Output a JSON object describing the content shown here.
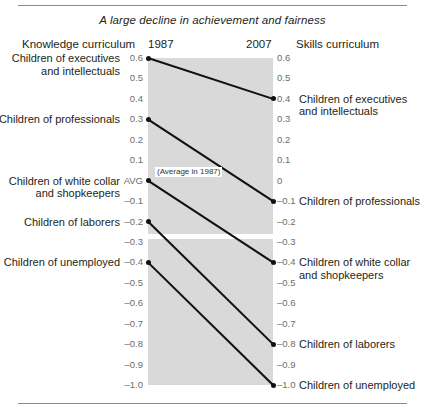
{
  "figure": {
    "title": "A large decline in achievement and fairness",
    "header": {
      "left_label": "Knowledge curriculum",
      "year_start": "1987",
      "year_end": "2007",
      "right_label": "Skills curriculum"
    },
    "annotation": "(Average in 1987)",
    "avg_tick": "AVG"
  },
  "chart_data": {
    "type": "line",
    "subtype": "slopegraph",
    "title": "A large decline in achievement and fairness",
    "xlabel": "",
    "ylabel": "",
    "x": [
      "1987",
      "2007"
    ],
    "ylim": [
      -1.0,
      0.6
    ],
    "grid": false,
    "legend": "none",
    "left_axis_title": "Knowledge curriculum",
    "right_axis_title": "Skills curriculum",
    "annotations": [
      {
        "text": "(Average in 1987)",
        "x": "1987",
        "y": 0.0
      }
    ],
    "yticks_left": [
      {
        "value": 0.6,
        "label": "0.6"
      },
      {
        "value": 0.5,
        "label": "0.5"
      },
      {
        "value": 0.4,
        "label": "0.4"
      },
      {
        "value": 0.3,
        "label": "0.3"
      },
      {
        "value": 0.2,
        "label": "0.2"
      },
      {
        "value": 0.1,
        "label": "0.1"
      },
      {
        "value": 0.0,
        "label": "AVG"
      },
      {
        "value": -0.1,
        "label": "–0.1"
      },
      {
        "value": -0.2,
        "label": "–0.2"
      },
      {
        "value": -0.3,
        "label": "–0.3"
      },
      {
        "value": -0.4,
        "label": "–0.4"
      },
      {
        "value": -0.5,
        "label": "–0.5"
      },
      {
        "value": -0.6,
        "label": "–0.6"
      },
      {
        "value": -0.7,
        "label": "–0.7"
      },
      {
        "value": -0.8,
        "label": "–0.8"
      },
      {
        "value": -0.9,
        "label": "–0.9"
      },
      {
        "value": -1.0,
        "label": "–1.0"
      }
    ],
    "yticks_right": [
      {
        "value": 0.6,
        "label": "0.6"
      },
      {
        "value": 0.5,
        "label": "0.5"
      },
      {
        "value": 0.4,
        "label": "0.4"
      },
      {
        "value": 0.3,
        "label": "0.3"
      },
      {
        "value": 0.2,
        "label": "0.2"
      },
      {
        "value": 0.1,
        "label": "0.1"
      },
      {
        "value": 0.0,
        "label": "0"
      },
      {
        "value": -0.1,
        "label": "–0.1"
      },
      {
        "value": -0.2,
        "label": "–0.2"
      },
      {
        "value": -0.3,
        "label": "–0.3"
      },
      {
        "value": -0.4,
        "label": "–0.4"
      },
      {
        "value": -0.5,
        "label": "–0.5"
      },
      {
        "value": -0.6,
        "label": "–0.6"
      },
      {
        "value": -0.7,
        "label": "–0.7"
      },
      {
        "value": -0.8,
        "label": "–0.8"
      },
      {
        "value": -0.9,
        "label": "–0.9"
      },
      {
        "value": -1.0,
        "label": "–1.0"
      }
    ],
    "series": [
      {
        "name": "Children of executives and intellectuals",
        "left_label": "Children of executives\nand intellectuals",
        "right_label": "Children of executives\nand intellectuals",
        "values": [
          0.6,
          0.4
        ],
        "left_value_label": "0.6",
        "right_value_label": "0.4"
      },
      {
        "name": "Children of professionals",
        "left_label": "Children of professionals",
        "right_label": "Children of professionals",
        "values": [
          0.3,
          -0.1
        ],
        "left_value_label": "0.3",
        "right_value_label": "–0.1"
      },
      {
        "name": "Children of white collar and shopkeepers",
        "left_label": "Children of white collar\nand shopkeepers",
        "right_label": "Children of white collar\nand shopkeepers",
        "values": [
          0.0,
          -0.4
        ],
        "left_value_label": "AVG",
        "right_value_label": "–0.4"
      },
      {
        "name": "Children of laborers",
        "left_label": "Children of laborers",
        "right_label": "Children of laborers",
        "values": [
          -0.2,
          -0.8
        ],
        "left_value_label": "–0.2",
        "right_value_label": "–0.8"
      },
      {
        "name": "Children of unemployed",
        "left_label": "Children of unemployed",
        "right_label": "Children of unemployed",
        "values": [
          -0.4,
          -1.0
        ],
        "left_value_label": "–0.4",
        "right_value_label": "–1.0"
      }
    ]
  }
}
